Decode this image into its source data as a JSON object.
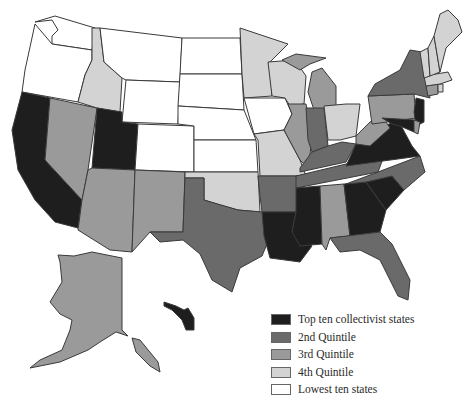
{
  "map": {
    "title": "",
    "categories": [
      {
        "key": "top",
        "label": "Top ten collectivist states",
        "color": "#1e1e1e"
      },
      {
        "key": "q2",
        "label": "2nd Quintile",
        "color": "#6a6a6a"
      },
      {
        "key": "q3",
        "label": "3rd Quintile",
        "color": "#9a9a9a"
      },
      {
        "key": "q4",
        "label": "4th Quintile",
        "color": "#d3d3d3"
      },
      {
        "key": "low",
        "label": "Lowest ten states",
        "color": "#ffffff"
      }
    ],
    "states": {
      "WA": "low",
      "OR": "low",
      "CA": "top",
      "NV": "q3",
      "ID": "q4",
      "MT": "low",
      "WY": "low",
      "UT": "top",
      "AZ": "q3",
      "CO": "low",
      "NM": "q3",
      "ND": "low",
      "SD": "low",
      "NE": "low",
      "KS": "low",
      "OK": "q4",
      "TX": "q2",
      "MN": "q4",
      "IA": "low",
      "MO": "q4",
      "AR": "q2",
      "LA": "top",
      "WI": "q4",
      "IL": "q3",
      "MI": "q3",
      "IN": "q2",
      "OH": "q4",
      "KY": "q2",
      "TN": "q2",
      "MS": "top",
      "AL": "q3",
      "GA": "top",
      "FL": "q2",
      "SC": "top",
      "NC": "q2",
      "VA": "top",
      "WV": "q3",
      "PA": "q3",
      "NY": "q2",
      "NJ": "top",
      "MD": "top",
      "DE": "q3",
      "CT": "q3",
      "RI": "q4",
      "MA": "q4",
      "VT": "q4",
      "NH": "q4",
      "ME": "q4",
      "AK": "q3",
      "HI": "top"
    }
  }
}
